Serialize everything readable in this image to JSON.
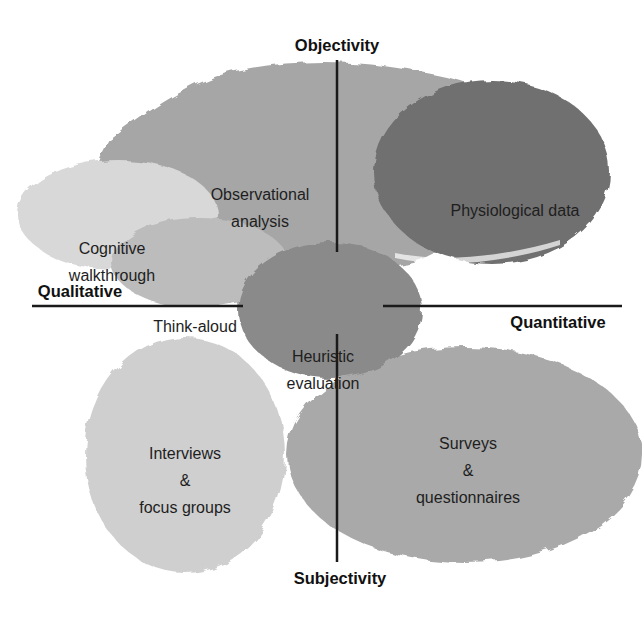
{
  "axes": {
    "top": "Objectivity",
    "bottom": "Subjectivity",
    "left": "Qualitative",
    "right": "Quantitative"
  },
  "methods": [
    {
      "id": "observational",
      "lines": [
        "Observational",
        "analysis"
      ],
      "shade": "#a4a4a4"
    },
    {
      "id": "physiological",
      "lines": [
        "Physiological data"
      ],
      "shade": "#6f6f6f"
    },
    {
      "id": "cognitive",
      "lines": [
        "Cognitive",
        "walkthrough"
      ],
      "shade": "#d6d6d6"
    },
    {
      "id": "thinkaloud",
      "lines": [
        "Think-aloud"
      ],
      "shade": "#b9b9b9"
    },
    {
      "id": "heuristic",
      "lines": [
        "Heuristic",
        "evaluation"
      ],
      "shade": "#8a8a8a"
    },
    {
      "id": "interviews",
      "lines": [
        "Interviews",
        "&",
        "focus groups"
      ],
      "shade": "#cfcfcf"
    },
    {
      "id": "surveys",
      "lines": [
        "Surveys",
        "&",
        "questionnaires"
      ],
      "shade": "#a8a8a8"
    }
  ],
  "colors": {
    "axis_line": "#1a1a1a",
    "background": "#ffffff"
  }
}
